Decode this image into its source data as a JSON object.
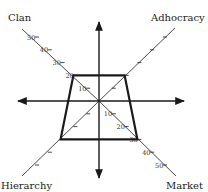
{
  "chart_data": {
    "type": "radar",
    "title": "",
    "axes": [
      "Clan",
      "Adhocracy",
      "Market",
      "Hierarchy"
    ],
    "values": [
      20,
      20,
      30,
      30
    ],
    "series": [
      {
        "name": "Profile",
        "values": [
          20,
          20,
          30,
          30
        ]
      }
    ],
    "tick_values": [
      10,
      20,
      30,
      40,
      50
    ],
    "labelled_ticks": {
      "Clan": [
        "10",
        "20",
        "30",
        "40",
        "50"
      ],
      "Market": [
        "10",
        "20",
        "30",
        "40",
        "50"
      ]
    },
    "range": [
      0,
      50
    ],
    "grid": false,
    "legend": "none",
    "colors": {
      "polygon": "#1a1a1a",
      "axis": "#1a1a1a",
      "text": "#222222"
    }
  }
}
